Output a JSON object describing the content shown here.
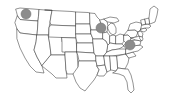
{
  "figure": {
    "kind": "choropleth-outline-map",
    "width_px": 170,
    "height_px": 103,
    "background_color": "#ffffff",
    "outline_color": "#3a3a3a",
    "outline_width_px": 0.55,
    "fill_color": "#ffffff"
  },
  "chart_data": {
    "type": "scatter",
    "title": "",
    "subtitle": "",
    "xlabel": "",
    "ylabel": "",
    "grid": false,
    "legend": "none",
    "basemap": "united-states-lower-48-state-boundaries",
    "marker_style": {
      "shape": "circle",
      "fill_color": "#8c8c8c",
      "edge_color": "#6e6e6e",
      "radius_px": 5,
      "opacity": 1
    },
    "points": [
      {
        "label": "Pacific Northwest marker",
        "region": "Washington",
        "x_px": 26,
        "y_px": 14,
        "radius_px": 5,
        "color": "#8c8c8c"
      },
      {
        "label": "Upper Midwest marker",
        "region": "Wisconsin",
        "x_px": 101,
        "y_px": 28,
        "radius_px": 5,
        "color": "#8c8c8c"
      },
      {
        "label": "Mid-Atlantic marker",
        "region": "Virginia / Maryland",
        "x_px": 130,
        "y_px": 45,
        "radius_px": 5,
        "color": "#8c8c8c"
      }
    ],
    "point_count": 3
  },
  "accessibility": {
    "alt_text": "Outline map of the contiguous United States with state borders and three gray circular markers"
  }
}
